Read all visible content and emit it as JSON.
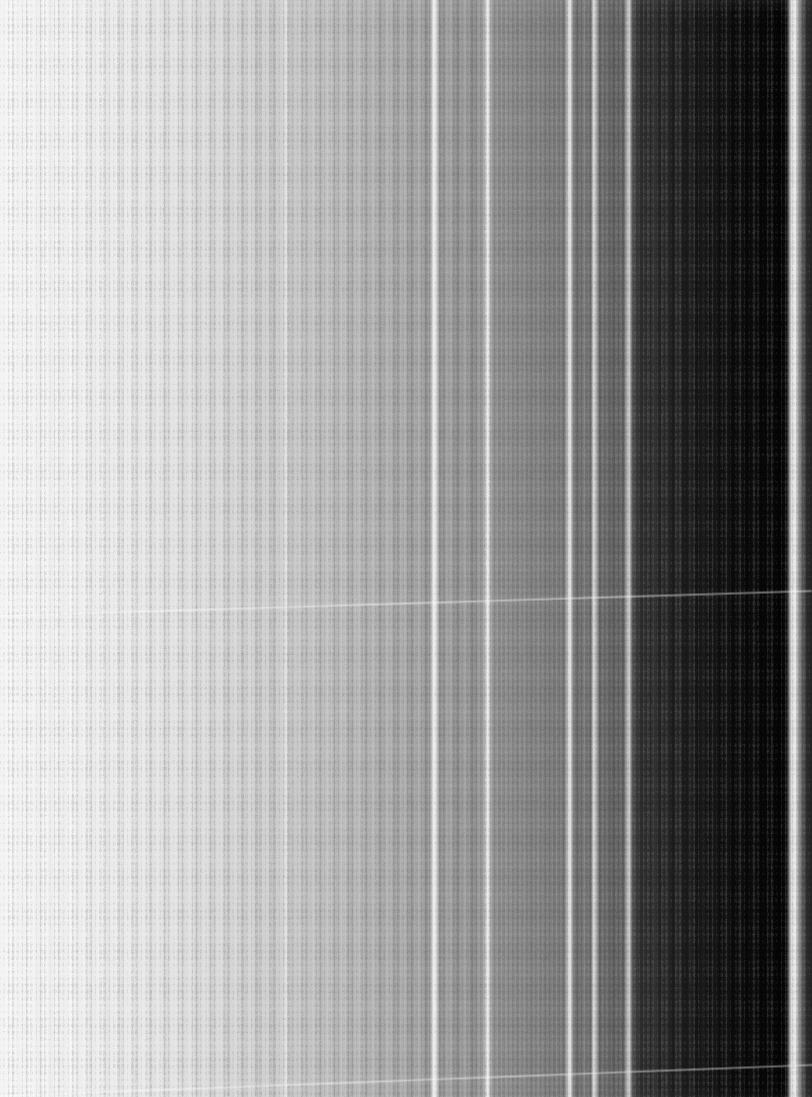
{
  "image": {
    "title": "Grayscale vertical stripe spectrum",
    "kind": "spectrum-stripes",
    "width": 812,
    "height": 1097,
    "background": "#ffffff",
    "description": "Vertical grayscale bands forming a left-to-right gradient from near-white to black, overlaid with thin bright emission-like lines and two faint diagonal streaks."
  },
  "chart_data": {
    "type": "heatmap",
    "subtitle": "",
    "xlabel": "",
    "ylabel": "",
    "grid": false,
    "legend": "none",
    "axis_visible": false,
    "tick_labels_x": [],
    "tick_labels_y": [],
    "xlim": [
      0,
      812
    ],
    "ylim": [
      0,
      1097
    ],
    "orientation": "vertical-stripes",
    "colormap": "grayscale",
    "value_range": [
      0,
      255
    ],
    "note": "Each stripe spans the full image height. x = left pixel, w = width in pixels, v = 8-bit gray level.",
    "stripes": [
      {
        "x": 0,
        "w": 7,
        "v": 243
      },
      {
        "x": 7,
        "w": 8,
        "v": 247
      },
      {
        "x": 15,
        "w": 10,
        "v": 241
      },
      {
        "x": 25,
        "w": 9,
        "v": 245
      },
      {
        "x": 34,
        "w": 8,
        "v": 238
      },
      {
        "x": 42,
        "w": 6,
        "v": 246
      },
      {
        "x": 48,
        "w": 5,
        "v": 235
      },
      {
        "x": 53,
        "w": 7,
        "v": 243
      },
      {
        "x": 60,
        "w": 9,
        "v": 237
      },
      {
        "x": 69,
        "w": 6,
        "v": 246
      },
      {
        "x": 75,
        "w": 5,
        "v": 233
      },
      {
        "x": 80,
        "w": 8,
        "v": 240
      },
      {
        "x": 88,
        "w": 7,
        "v": 232
      },
      {
        "x": 95,
        "w": 10,
        "v": 238
      },
      {
        "x": 105,
        "w": 6,
        "v": 229
      },
      {
        "x": 111,
        "w": 8,
        "v": 236
      },
      {
        "x": 119,
        "w": 5,
        "v": 226
      },
      {
        "x": 124,
        "w": 9,
        "v": 234
      },
      {
        "x": 133,
        "w": 7,
        "v": 225
      },
      {
        "x": 140,
        "w": 8,
        "v": 232
      },
      {
        "x": 148,
        "w": 6,
        "v": 222
      },
      {
        "x": 154,
        "w": 9,
        "v": 229
      },
      {
        "x": 163,
        "w": 7,
        "v": 219
      },
      {
        "x": 170,
        "w": 10,
        "v": 227
      },
      {
        "x": 180,
        "w": 6,
        "v": 216
      },
      {
        "x": 186,
        "w": 8,
        "v": 224
      },
      {
        "x": 194,
        "w": 7,
        "v": 213
      },
      {
        "x": 201,
        "w": 9,
        "v": 221
      },
      {
        "x": 210,
        "w": 6,
        "v": 209
      },
      {
        "x": 216,
        "w": 8,
        "v": 218
      },
      {
        "x": 224,
        "w": 7,
        "v": 206
      },
      {
        "x": 231,
        "w": 10,
        "v": 214
      },
      {
        "x": 241,
        "w": 6,
        "v": 202
      },
      {
        "x": 247,
        "w": 8,
        "v": 211
      },
      {
        "x": 255,
        "w": 7,
        "v": 199
      },
      {
        "x": 262,
        "w": 9,
        "v": 207
      },
      {
        "x": 271,
        "w": 5,
        "v": 195
      },
      {
        "x": 276,
        "w": 8,
        "v": 204
      },
      {
        "x": 284,
        "w": 4,
        "v": 224
      },
      {
        "x": 288,
        "w": 7,
        "v": 192
      },
      {
        "x": 295,
        "w": 9,
        "v": 200
      },
      {
        "x": 304,
        "w": 6,
        "v": 188
      },
      {
        "x": 310,
        "w": 8,
        "v": 196
      },
      {
        "x": 318,
        "w": 7,
        "v": 184
      },
      {
        "x": 325,
        "w": 9,
        "v": 192
      },
      {
        "x": 334,
        "w": 6,
        "v": 180
      },
      {
        "x": 340,
        "w": 8,
        "v": 188
      },
      {
        "x": 348,
        "w": 7,
        "v": 176
      },
      {
        "x": 355,
        "w": 9,
        "v": 184
      },
      {
        "x": 364,
        "w": 6,
        "v": 172
      },
      {
        "x": 370,
        "w": 8,
        "v": 179
      },
      {
        "x": 378,
        "w": 7,
        "v": 167
      },
      {
        "x": 385,
        "w": 9,
        "v": 175
      },
      {
        "x": 394,
        "w": 6,
        "v": 163
      },
      {
        "x": 400,
        "w": 8,
        "v": 170
      },
      {
        "x": 408,
        "w": 7,
        "v": 158
      },
      {
        "x": 415,
        "w": 9,
        "v": 165
      },
      {
        "x": 424,
        "w": 8,
        "v": 152
      },
      {
        "x": 432,
        "w": 5,
        "v": 236
      },
      {
        "x": 437,
        "w": 9,
        "v": 150
      },
      {
        "x": 446,
        "w": 8,
        "v": 158
      },
      {
        "x": 454,
        "w": 7,
        "v": 146
      },
      {
        "x": 461,
        "w": 9,
        "v": 154
      },
      {
        "x": 470,
        "w": 8,
        "v": 142
      },
      {
        "x": 478,
        "w": 7,
        "v": 149
      },
      {
        "x": 485,
        "w": 5,
        "v": 233
      },
      {
        "x": 490,
        "w": 9,
        "v": 138
      },
      {
        "x": 499,
        "w": 8,
        "v": 145
      },
      {
        "x": 507,
        "w": 7,
        "v": 133
      },
      {
        "x": 514,
        "w": 9,
        "v": 140
      },
      {
        "x": 523,
        "w": 8,
        "v": 128
      },
      {
        "x": 531,
        "w": 7,
        "v": 135
      },
      {
        "x": 538,
        "w": 8,
        "v": 123
      },
      {
        "x": 546,
        "w": 6,
        "v": 130
      },
      {
        "x": 552,
        "w": 7,
        "v": 118
      },
      {
        "x": 559,
        "w": 8,
        "v": 125
      },
      {
        "x": 567,
        "w": 5,
        "v": 220
      },
      {
        "x": 572,
        "w": 7,
        "v": 112
      },
      {
        "x": 579,
        "w": 8,
        "v": 119
      },
      {
        "x": 587,
        "w": 5,
        "v": 105
      },
      {
        "x": 592,
        "w": 5,
        "v": 214
      },
      {
        "x": 597,
        "w": 7,
        "v": 100
      },
      {
        "x": 604,
        "w": 8,
        "v": 108
      },
      {
        "x": 612,
        "w": 7,
        "v": 94
      },
      {
        "x": 619,
        "w": 7,
        "v": 101
      },
      {
        "x": 626,
        "w": 5,
        "v": 200
      },
      {
        "x": 631,
        "w": 8,
        "v": 62
      },
      {
        "x": 639,
        "w": 7,
        "v": 48
      },
      {
        "x": 646,
        "w": 6,
        "v": 41
      },
      {
        "x": 652,
        "w": 5,
        "v": 55
      },
      {
        "x": 657,
        "w": 7,
        "v": 36
      },
      {
        "x": 664,
        "w": 6,
        "v": 44
      },
      {
        "x": 670,
        "w": 5,
        "v": 30
      },
      {
        "x": 675,
        "w": 7,
        "v": 38
      },
      {
        "x": 682,
        "w": 6,
        "v": 26
      },
      {
        "x": 688,
        "w": 5,
        "v": 33
      },
      {
        "x": 693,
        "w": 7,
        "v": 21
      },
      {
        "x": 700,
        "w": 6,
        "v": 28
      },
      {
        "x": 706,
        "w": 5,
        "v": 17
      },
      {
        "x": 711,
        "w": 7,
        "v": 24
      },
      {
        "x": 718,
        "w": 6,
        "v": 14
      },
      {
        "x": 724,
        "w": 6,
        "v": 20
      },
      {
        "x": 730,
        "w": 7,
        "v": 11
      },
      {
        "x": 737,
        "w": 6,
        "v": 16
      },
      {
        "x": 743,
        "w": 7,
        "v": 9
      },
      {
        "x": 750,
        "w": 8,
        "v": 13
      },
      {
        "x": 758,
        "w": 8,
        "v": 7
      },
      {
        "x": 766,
        "w": 8,
        "v": 10
      },
      {
        "x": 774,
        "w": 8,
        "v": 5
      },
      {
        "x": 782,
        "w": 7,
        "v": 8
      },
      {
        "x": 789,
        "w": 9,
        "v": 236
      },
      {
        "x": 798,
        "w": 4,
        "v": 120
      },
      {
        "x": 802,
        "w": 4,
        "v": 70
      },
      {
        "x": 806,
        "w": 6,
        "v": 40
      }
    ],
    "bright_lines": [
      {
        "x": 284,
        "w": 3,
        "v": 236
      },
      {
        "x": 432,
        "w": 4,
        "v": 250
      },
      {
        "x": 485,
        "w": 4,
        "v": 248
      },
      {
        "x": 567,
        "w": 4,
        "v": 238
      },
      {
        "x": 592,
        "w": 4,
        "v": 234
      },
      {
        "x": 626,
        "w": 4,
        "v": 226
      },
      {
        "x": 789,
        "w": 8,
        "v": 250
      }
    ],
    "diagonal_streaks": [
      {
        "name": "upper-streak",
        "x0": 0,
        "y0": 614,
        "x1": 812,
        "y1": 589,
        "thickness": 2,
        "brightness": 0.42
      },
      {
        "name": "lower-streak",
        "x0": 0,
        "y0": 1094,
        "x1": 812,
        "y1": 1063,
        "thickness": 2,
        "brightness": 0.4
      }
    ],
    "gradient_summary": {
      "left_value": 245,
      "mid_value": 150,
      "right_value": 6,
      "direction": "left-to-right dark-ening"
    }
  }
}
